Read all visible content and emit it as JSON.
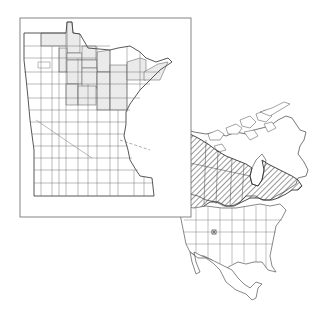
{
  "figure": {
    "type": "species distribution map",
    "panels": [
      {
        "id": "minnesota",
        "label": "Minnesota county distribution",
        "shaded_region": "north-central and northeastern counties",
        "shade_color": "#e4e4e4",
        "line_color": "#555555"
      },
      {
        "id": "north-america",
        "label": "North American range",
        "range_pattern": "diagonal hatching",
        "range_region": "boreal Canada and Alaska, south into Great Lakes and northern Rockies",
        "disjunct_marker": "isolated point in Colorado",
        "line_color": "#444444"
      }
    ]
  },
  "colors": {
    "background": "#ffffff",
    "outline": "#555555",
    "shade": "#e6e6e6",
    "hatch": "#333333"
  }
}
